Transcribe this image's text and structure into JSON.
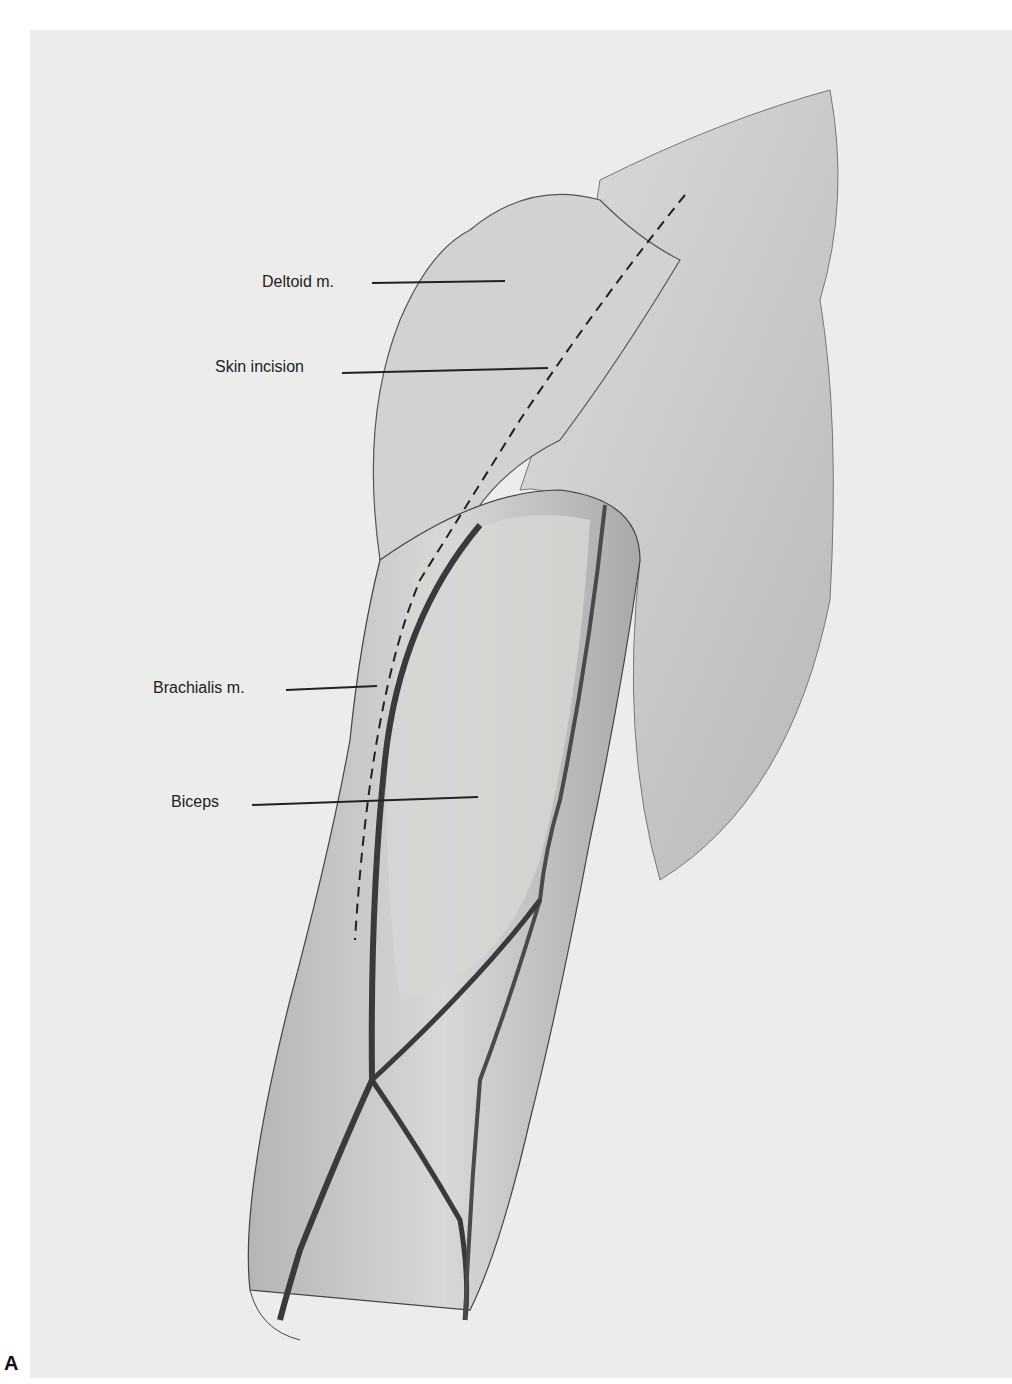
{
  "figure": {
    "panel_letter": "A",
    "labels": [
      {
        "id": "deltoid",
        "text": "Deltoid m.",
        "x": 262,
        "y": 273,
        "line": [
          372,
          283,
          505,
          281
        ]
      },
      {
        "id": "skin-incision",
        "text": "Skin incision",
        "x": 215,
        "y": 358,
        "line": [
          342,
          373,
          548,
          368
        ]
      },
      {
        "id": "brachialis",
        "text": "Brachialis m.",
        "x": 153,
        "y": 679,
        "line": [
          286,
          690,
          377,
          686
        ]
      },
      {
        "id": "biceps",
        "text": "Biceps",
        "x": 171,
        "y": 793,
        "line": [
          252,
          805,
          478,
          797
        ]
      }
    ],
    "colors": {
      "background": "#ececeb",
      "muscle_shade": "#c9c9c7",
      "muscle_dark": "#8d8d8b",
      "vessel": "#3a3a3a",
      "label_line": "#222222"
    }
  }
}
